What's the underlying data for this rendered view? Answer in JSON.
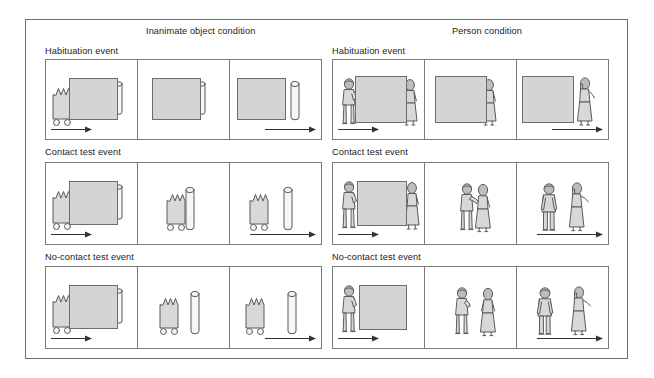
{
  "figure": {
    "columns": [
      {
        "id": "inanimate",
        "title": "Inanimate object condition"
      },
      {
        "id": "person",
        "title": "Person condition"
      }
    ],
    "rows": [
      {
        "id": "habituation",
        "label": "Habituation event"
      },
      {
        "id": "contact-test",
        "label": "Contact test event"
      },
      {
        "id": "no-contact-test",
        "label": "No-contact test event"
      }
    ],
    "panels_per_row": 3,
    "motion_arrow_panels": [
      1,
      3
    ],
    "colors": {
      "frame": "#6f6f6f",
      "panel_border": "#7a7a7a",
      "screen_fill": "#d4d4d4",
      "object_fill": "#d8d8d8",
      "cylinder_fill": "#f6f6f6",
      "ink": "#5a5a5a",
      "text": "#1a1a1a",
      "background": "#ffffff"
    },
    "icons": {
      "cart_object": "crown-topped-box-on-wheels",
      "cylinder": "upright-cylinder",
      "screen": "grey-occluding-screen",
      "male_figure": "standing-man",
      "female_figure": "standing-woman",
      "arrow": "rightward-motion-arrow"
    },
    "scenes": {
      "inanimate": {
        "habituation": [
          {
            "contents": "cart behind screen at left, screen occluding",
            "arrow": "left"
          },
          {
            "contents": "screen alone, cart fully hidden",
            "arrow": "none"
          },
          {
            "contents": "screen with cylinder emerging at right",
            "arrow": "right"
          }
        ],
        "contact-test": [
          {
            "contents": "cart at left beside screen",
            "arrow": "left"
          },
          {
            "contents": "cart touching cylinder, no screen",
            "arrow": "none"
          },
          {
            "contents": "cart apart from cylinder",
            "arrow": "right"
          }
        ],
        "no-contact-test": [
          {
            "contents": "cart at left beside screen",
            "arrow": "left"
          },
          {
            "contents": "cart with gap to cylinder, no screen",
            "arrow": "none"
          },
          {
            "contents": "cart with gap to cylinder",
            "arrow": "right"
          }
        ]
      },
      "person": {
        "habituation": [
          {
            "contents": "man at left of screen, woman at right edge",
            "arrow": "left"
          },
          {
            "contents": "screen alone with woman at right edge",
            "arrow": "none"
          },
          {
            "contents": "screen with woman standing at right",
            "arrow": "right"
          }
        ],
        "contact-test": [
          {
            "contents": "man at left beside screen, woman at screen right",
            "arrow": "left"
          },
          {
            "contents": "man and woman touching, no screen",
            "arrow": "none"
          },
          {
            "contents": "man and woman apart",
            "arrow": "right"
          }
        ],
        "no-contact-test": [
          {
            "contents": "man at left beside screen",
            "arrow": "left"
          },
          {
            "contents": "man and woman separated by a gap, no screen",
            "arrow": "none"
          },
          {
            "contents": "man and woman separated by a gap",
            "arrow": "right"
          }
        ]
      }
    }
  }
}
